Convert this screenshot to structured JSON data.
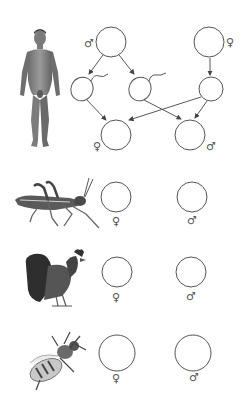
{
  "diagram": {
    "type": "sex-determination-worksheet",
    "colors": {
      "line": "#555555",
      "background": "#ffffff"
    },
    "symbols": {
      "male": "♂",
      "female": "♀"
    },
    "human": {
      "organism": "human",
      "parents": [
        {
          "id": "parent-male",
          "sex_symbol": "♂"
        },
        {
          "id": "parent-female",
          "sex_symbol": "♀"
        }
      ],
      "gametes": [
        {
          "id": "sperm-1",
          "kind": "sperm"
        },
        {
          "id": "sperm-2",
          "kind": "sperm"
        },
        {
          "id": "egg",
          "kind": "egg"
        }
      ],
      "offspring": [
        {
          "id": "offspring-female",
          "sex_symbol": "♀"
        },
        {
          "id": "offspring-male",
          "sex_symbol": "♂"
        }
      ]
    },
    "rows": [
      {
        "organism": "grasshopper",
        "left_symbol": "♀",
        "right_symbol": "♂"
      },
      {
        "organism": "rooster",
        "left_symbol": "♀",
        "right_symbol": "♂"
      },
      {
        "organism": "bee",
        "left_symbol": "♀",
        "right_symbol": "♂"
      }
    ]
  }
}
